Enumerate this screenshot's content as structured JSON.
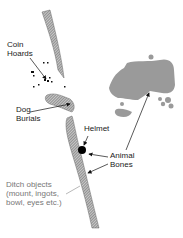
{
  "diagram": {
    "type": "archaeological site plan",
    "colors": {
      "ditch_hatch": "#8a8a8a",
      "enclosure_fill": "#9a9a9a",
      "label_text": "#1a1a1a",
      "label_grey": "#777777",
      "arrow": "#111111"
    },
    "labels": {
      "coin_hoards": {
        "line1": "Coin",
        "line2": "Hoards"
      },
      "dog_burials": {
        "line1": "Dog",
        "line2": "Burials"
      },
      "helmet": {
        "line1": "Helmet"
      },
      "animal_bones": {
        "line1": "Animal",
        "line2": "Bones"
      },
      "ditch_objects": {
        "line1": "Ditch objects",
        "line2": "(mount, ingots,",
        "line3": "bowl, eyes etc.)"
      }
    },
    "features": [
      "upper-ditch-segment",
      "dog-burial-ditch",
      "lower-ditch-segment",
      "coin-scatter",
      "helmet-findspot",
      "enclosure-building"
    ]
  }
}
